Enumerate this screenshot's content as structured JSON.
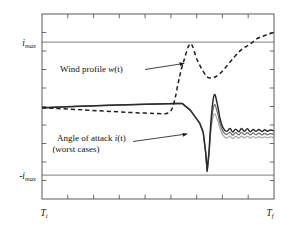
{
  "chart_data": {
    "type": "line",
    "title": "",
    "subtitle": "",
    "xlabel": "",
    "ylabel": "",
    "grid": false,
    "legend_position": "inline-annotations",
    "x_tick_labels": [
      "T_i",
      "T_f"
    ],
    "x_axis_left_label": "T",
    "x_axis_left_sub": "i",
    "x_axis_right_label": "T",
    "x_axis_right_sub": "f",
    "y_tick_labels": [
      "i_max",
      "-i_max"
    ],
    "y_upper_label_main": "i",
    "y_upper_label_sub": "max",
    "y_lower_label_main": "-i",
    "y_lower_label_sub": "max",
    "xlim": [
      0,
      1
    ],
    "ylim": [
      -1.45,
      1.45
    ],
    "reference_lines": [
      {
        "name": "i_max",
        "y": 1.0,
        "style": "solid",
        "color": "#5a5a5a"
      },
      {
        "name": "-i_max",
        "y": -1.0,
        "style": "solid",
        "color": "#5a5a5a"
      }
    ],
    "annotations": [
      {
        "id": "wind-profile",
        "text_line1": "Wind profile w(t)",
        "text_plain": "Wind profile ",
        "text_italic": "w",
        "text_tail": "(t)",
        "target_series": "wind_profile"
      },
      {
        "id": "angle-of-attack",
        "text_line1": "Angle of attack i(t)",
        "text_line2": "(worst cases)",
        "text_plain": "Angle of attack ",
        "text_italic": "i",
        "text_tail": "(t)",
        "target_series": "angle_of_attack_worst_case_1"
      }
    ],
    "series": [
      {
        "name": "wind_profile",
        "label": "Wind profile w(t)",
        "style": "dashed",
        "color": "#1f1f1f",
        "x": [
          0.0,
          0.06,
          0.12,
          0.18,
          0.24,
          0.3,
          0.36,
          0.42,
          0.48,
          0.53,
          0.545,
          0.56,
          0.575,
          0.59,
          0.61,
          0.64,
          0.67,
          0.7,
          0.715,
          0.73,
          0.75,
          0.775,
          0.8,
          0.825,
          0.85,
          0.875,
          0.9,
          0.925,
          0.95,
          0.975,
          1.0
        ],
        "y": [
          -0.02,
          -0.03,
          -0.042,
          -0.054,
          -0.066,
          -0.078,
          -0.09,
          -0.1,
          -0.108,
          -0.112,
          -0.095,
          -0.04,
          0.15,
          0.42,
          0.7,
          0.985,
          0.72,
          0.52,
          0.455,
          0.45,
          0.47,
          0.545,
          0.65,
          0.76,
          0.86,
          0.93,
          0.985,
          1.06,
          1.1,
          1.13,
          1.16
        ]
      },
      {
        "name": "angle_of_attack_worst_case_1",
        "label": "Angle of attack i(t) worst case (dark)",
        "style": "solid",
        "color": "#2b2b2b",
        "x": [
          0.0,
          0.1,
          0.2,
          0.3,
          0.4,
          0.5,
          0.59,
          0.605,
          0.64,
          0.68,
          0.695,
          0.705,
          0.712,
          0.72,
          0.73,
          0.742,
          0.755,
          0.768,
          0.78,
          0.795,
          0.81,
          0.822,
          0.835,
          0.848,
          0.86,
          0.872,
          0.885,
          0.898,
          0.91,
          0.922,
          0.935,
          0.948,
          0.96,
          0.972,
          0.985,
          1.0
        ],
        "y": [
          -0.02,
          -0.005,
          0.008,
          0.02,
          0.03,
          0.04,
          0.048,
          0.046,
          -0.06,
          -0.26,
          -0.4,
          -0.7,
          -1.01,
          -0.7,
          -0.15,
          0.18,
          0.05,
          -0.2,
          -0.33,
          -0.39,
          -0.345,
          -0.4,
          -0.355,
          -0.395,
          -0.345,
          -0.39,
          -0.35,
          -0.395,
          -0.36,
          -0.39,
          -0.362,
          -0.392,
          -0.365,
          -0.388,
          -0.368,
          -0.382
        ]
      },
      {
        "name": "angle_of_attack_worst_case_2",
        "label": "Angle of attack i(t) worst case (mid gray)",
        "style": "solid",
        "color": "#6e6e6e",
        "x": [
          0.0,
          0.1,
          0.2,
          0.3,
          0.4,
          0.5,
          0.59,
          0.605,
          0.64,
          0.68,
          0.695,
          0.705,
          0.712,
          0.72,
          0.73,
          0.742,
          0.755,
          0.768,
          0.78,
          0.795,
          0.81,
          0.822,
          0.835,
          0.848,
          0.86,
          0.872,
          0.885,
          0.898,
          0.91,
          0.922,
          0.935,
          0.948,
          0.96,
          0.972,
          0.985,
          1.0
        ],
        "y": [
          -0.02,
          -0.005,
          0.008,
          0.02,
          0.03,
          0.04,
          0.048,
          0.046,
          -0.06,
          -0.265,
          -0.41,
          -0.71,
          -1.015,
          -0.73,
          -0.24,
          0.02,
          -0.08,
          -0.275,
          -0.39,
          -0.44,
          -0.405,
          -0.45,
          -0.41,
          -0.445,
          -0.405,
          -0.44,
          -0.41,
          -0.445,
          -0.415,
          -0.442,
          -0.418,
          -0.444,
          -0.42,
          -0.442,
          -0.424,
          -0.438
        ]
      },
      {
        "name": "angle_of_attack_worst_case_3",
        "label": "Angle of attack i(t) worst case (light gray)",
        "style": "solid",
        "color": "#a8a8a8",
        "x": [
          0.0,
          0.1,
          0.2,
          0.3,
          0.4,
          0.5,
          0.59,
          0.605,
          0.64,
          0.68,
          0.695,
          0.705,
          0.712,
          0.72,
          0.73,
          0.742,
          0.755,
          0.768,
          0.78,
          0.795,
          0.81,
          0.822,
          0.835,
          0.848,
          0.86,
          0.872,
          0.885,
          0.898,
          0.91,
          0.922,
          0.935,
          0.948,
          0.96,
          0.972,
          0.985,
          1.0
        ],
        "y": [
          -0.02,
          -0.005,
          0.008,
          0.02,
          0.03,
          0.04,
          0.048,
          0.046,
          -0.062,
          -0.27,
          -0.42,
          -0.72,
          -1.02,
          -0.76,
          -0.33,
          -0.12,
          -0.2,
          -0.35,
          -0.45,
          -0.495,
          -0.465,
          -0.5,
          -0.468,
          -0.495,
          -0.465,
          -0.492,
          -0.468,
          -0.495,
          -0.47,
          -0.492,
          -0.472,
          -0.492,
          -0.474,
          -0.49,
          -0.476,
          -0.488
        ]
      }
    ]
  },
  "figure": {
    "background": "#ffffff",
    "frame_color": "#4a4a4a",
    "tick_count_x": 8,
    "tick_count_y": 9
  }
}
